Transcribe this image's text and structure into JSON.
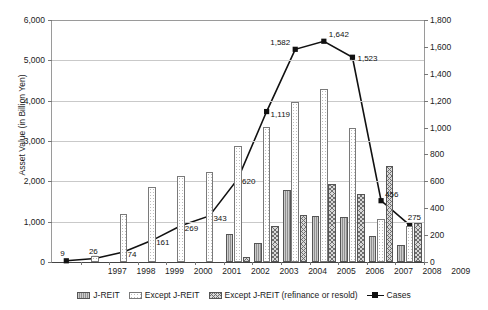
{
  "axes": {
    "ylabel": "Asset Value (in Billion Yen)",
    "left_ticks": [
      "6,000",
      "5,000",
      "4,000",
      "3,000",
      "2,000",
      "1,000",
      "0"
    ],
    "right_ticks": [
      "1,800",
      "1,600",
      "1,400",
      "1,200",
      "1,000",
      "800",
      "600",
      "400",
      "200",
      "0"
    ]
  },
  "legend": [
    {
      "key": "jreit",
      "label": "J-REIT"
    },
    {
      "key": "except",
      "label": "Except J-REIT"
    },
    {
      "key": "refi",
      "label": "Except J-REIT (refinance or resold)"
    },
    {
      "key": "cases",
      "label": "Cases"
    }
  ],
  "chart_data": {
    "type": "bar",
    "title": "",
    "xlabel": "",
    "ylabel": "Asset Value (in Billion Yen)",
    "y2label": "",
    "ylim": [
      0,
      6000
    ],
    "y2lim": [
      0,
      1800
    ],
    "grid": true,
    "legend_position": "bottom",
    "categories": [
      "1997",
      "1998",
      "1999",
      "2000",
      "2001",
      "2002",
      "2003",
      "2004",
      "2005",
      "2006",
      "2007",
      "2008",
      "2009"
    ],
    "series": [
      {
        "name": "J-REIT",
        "type": "bar",
        "axis": "left",
        "values": [
          0,
          0,
          0,
          0,
          0,
          0,
          700,
          480,
          1780,
          1150,
          1110,
          640,
          420
        ]
      },
      {
        "name": "Except J-REIT",
        "type": "bar",
        "axis": "left",
        "values": [
          0,
          150,
          1180,
          1860,
          2140,
          2230,
          2880,
          3350,
          3970,
          4300,
          3330,
          1060,
          900
        ]
      },
      {
        "name": "Except J-REIT (refinance or resold)",
        "type": "bar",
        "axis": "left",
        "values": [
          0,
          0,
          0,
          0,
          0,
          0,
          130,
          890,
          1160,
          1930,
          1680,
          2390,
          960
        ]
      },
      {
        "name": "Cases",
        "type": "line",
        "axis": "right",
        "values": [
          9,
          26,
          74,
          161,
          269,
          343,
          620,
          1119,
          1582,
          1642,
          1523,
          456,
          275
        ],
        "labels": [
          "9",
          "26",
          "74",
          "161",
          "269",
          "343",
          "620",
          "1,119",
          "1,582",
          "1,642",
          "1,523",
          "456",
          "275"
        ]
      }
    ]
  },
  "colors": {
    "line": "#111111",
    "grid": "#c9c9c9",
    "axis": "#444444",
    "jreit_fill": "#8f8f8f",
    "except_fill": "#ffffff",
    "refi_fill": "#d8d8d8"
  }
}
